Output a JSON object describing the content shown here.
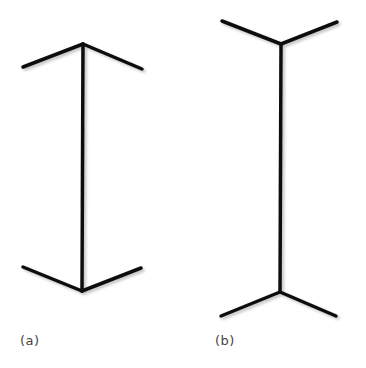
{
  "figure": {
    "line_color": "#111111",
    "line_width": 3.5,
    "panels": [
      {
        "label": "(a)",
        "label_pos": [
          20,
          333
        ],
        "shaft": [
          [
            83,
            44
          ],
          [
            82,
            291
          ]
        ],
        "fins": [
          [
            [
              83,
              44
            ],
            [
              23,
              67
            ]
          ],
          [
            [
              83,
              44
            ],
            [
              142,
              69
            ]
          ],
          [
            [
              82,
              291
            ],
            [
              23,
              267
            ]
          ],
          [
            [
              82,
              291
            ],
            [
              141,
              268
            ]
          ]
        ]
      },
      {
        "label": "(b)",
        "label_pos": [
          215,
          333
        ],
        "shaft": [
          [
            281,
            44
          ],
          [
            280,
            292
          ]
        ],
        "fins": [
          [
            [
              281,
              44
            ],
            [
              222,
              21
            ]
          ],
          [
            [
              281,
              44
            ],
            [
              337,
              22
            ]
          ],
          [
            [
              280,
              292
            ],
            [
              221,
              316
            ]
          ],
          [
            [
              280,
              292
            ],
            [
              336,
              316
            ]
          ]
        ]
      }
    ]
  }
}
